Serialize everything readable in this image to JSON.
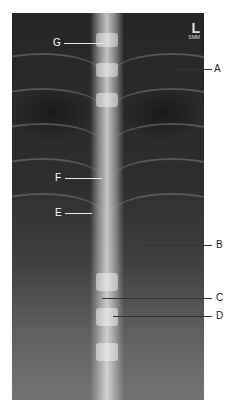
{
  "figure": {
    "type": "radiograph",
    "marker": {
      "side": "L",
      "sub": "SMM"
    },
    "labels": [
      {
        "id": "G",
        "text": "G"
      },
      {
        "id": "A",
        "text": "A"
      },
      {
        "id": "F",
        "text": "F"
      },
      {
        "id": "E",
        "text": "E"
      },
      {
        "id": "B",
        "text": "B"
      },
      {
        "id": "C",
        "text": "C"
      },
      {
        "id": "D",
        "text": "D"
      }
    ]
  }
}
